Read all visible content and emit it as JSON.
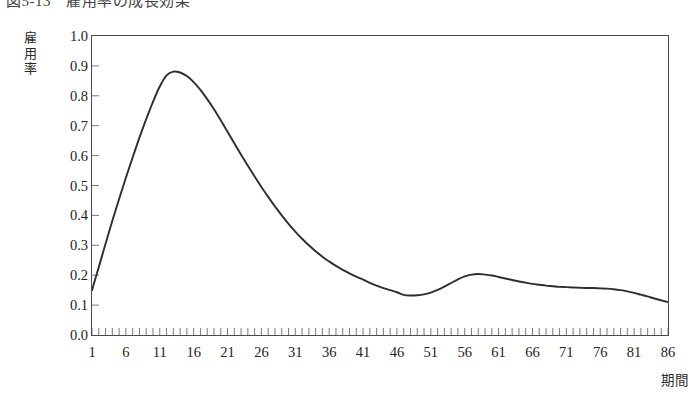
{
  "figure": {
    "title_number": "図5-13",
    "title_text": "雇用率の成長効果",
    "title_full": "図5-13　雇用率の成長効果"
  },
  "axes": {
    "y_label": "雇用率",
    "y_label_chars": [
      "雇",
      "用",
      "率"
    ],
    "x_label": "期間",
    "y_ticks": [
      "1.0",
      "0.9",
      "0.8",
      "0.7",
      "0.6",
      "0.5",
      "0.4",
      "0.3",
      "0.2",
      "0.1",
      "0.0"
    ],
    "x_ticks": [
      "1",
      "6",
      "11",
      "16",
      "21",
      "26",
      "31",
      "36",
      "41",
      "46",
      "51",
      "56",
      "61",
      "66",
      "71",
      "76",
      "81",
      "86"
    ]
  },
  "style": {
    "line_color": "#2e2e2e",
    "frame_color": "#4a4a4a",
    "background": "#ffffff",
    "text_color": "#232323"
  },
  "chart_data": {
    "type": "line",
    "title": "図5-13　雇用率の成長効果",
    "xlabel": "期間",
    "ylabel": "雇用率",
    "xlim": [
      1,
      86
    ],
    "ylim": [
      0.0,
      1.0
    ],
    "grid": false,
    "legend": null,
    "x_tick_interval": 5,
    "y_tick_interval": 0.1,
    "minor_ticks": "every period (1..86) on x-axis, inward",
    "series": [
      {
        "name": "雇用率",
        "x": [
          1,
          2,
          3,
          4,
          5,
          6,
          7,
          8,
          9,
          10,
          11,
          12,
          13,
          14,
          15,
          16,
          17,
          18,
          19,
          20,
          21,
          22,
          23,
          24,
          25,
          26,
          27,
          28,
          29,
          30,
          31,
          32,
          33,
          34,
          35,
          36,
          37,
          38,
          39,
          40,
          41,
          42,
          43,
          44,
          45,
          46,
          47,
          48,
          49,
          50,
          51,
          52,
          53,
          54,
          55,
          56,
          57,
          58,
          59,
          60,
          61,
          62,
          63,
          64,
          65,
          66,
          67,
          68,
          69,
          70,
          71,
          72,
          73,
          74,
          75,
          76,
          77,
          78,
          79,
          80,
          81,
          82,
          83,
          84,
          85,
          86
        ],
        "y": [
          0.15,
          0.227,
          0.305,
          0.382,
          0.455,
          0.526,
          0.594,
          0.66,
          0.722,
          0.78,
          0.831,
          0.868,
          0.881,
          0.878,
          0.866,
          0.846,
          0.82,
          0.789,
          0.755,
          0.718,
          0.68,
          0.641,
          0.603,
          0.566,
          0.53,
          0.495,
          0.462,
          0.43,
          0.4,
          0.372,
          0.346,
          0.322,
          0.3,
          0.28,
          0.262,
          0.246,
          0.231,
          0.218,
          0.206,
          0.195,
          0.185,
          0.174,
          0.165,
          0.157,
          0.15,
          0.143,
          0.134,
          0.132,
          0.133,
          0.136,
          0.142,
          0.151,
          0.162,
          0.174,
          0.186,
          0.196,
          0.202,
          0.204,
          0.202,
          0.199,
          0.194,
          0.189,
          0.184,
          0.179,
          0.175,
          0.171,
          0.168,
          0.165,
          0.163,
          0.161,
          0.16,
          0.159,
          0.158,
          0.157,
          0.157,
          0.156,
          0.155,
          0.153,
          0.15,
          0.146,
          0.141,
          0.135,
          0.129,
          0.122,
          0.116,
          0.11
        ]
      }
    ]
  }
}
